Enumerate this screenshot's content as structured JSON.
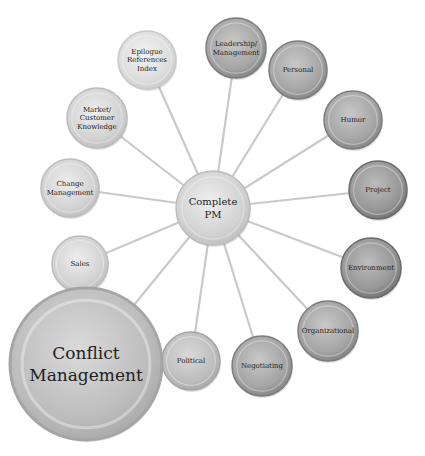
{
  "diagram": {
    "center": {
      "label_lines": [
        "Complete",
        "PM"
      ],
      "x": 213,
      "y": 208,
      "r": 37,
      "tone": "light"
    },
    "nodes": [
      {
        "id": "epilogue",
        "label_lines": [
          "Epilogue",
          "References",
          "Index"
        ],
        "x": 147,
        "y": 60,
        "r": 29,
        "tone": "lightest"
      },
      {
        "id": "leadership",
        "label_lines": [
          "Leadership/",
          "Management"
        ],
        "x": 236,
        "y": 48,
        "r": 30,
        "tone": "dark"
      },
      {
        "id": "personal",
        "label_lines": [
          "Personal"
        ],
        "x": 298,
        "y": 70,
        "r": 29,
        "tone": "dark"
      },
      {
        "id": "humor",
        "label_lines": [
          "Humor"
        ],
        "x": 353,
        "y": 120,
        "r": 29,
        "tone": "dark"
      },
      {
        "id": "project",
        "label_lines": [
          "Project"
        ],
        "x": 378,
        "y": 190,
        "r": 29,
        "tone": "darker"
      },
      {
        "id": "environment",
        "label_lines": [
          "Environment"
        ],
        "x": 371,
        "y": 268,
        "r": 30,
        "tone": "darker"
      },
      {
        "id": "organizational",
        "label_lines": [
          "Organizational"
        ],
        "x": 328,
        "y": 331,
        "r": 30,
        "tone": "dark"
      },
      {
        "id": "negotiating",
        "label_lines": [
          "Negotiating"
        ],
        "x": 262,
        "y": 366,
        "r": 30,
        "tone": "dark"
      },
      {
        "id": "political",
        "label_lines": [
          "Political"
        ],
        "x": 191,
        "y": 361,
        "r": 29,
        "tone": "medium"
      },
      {
        "id": "sales",
        "label_lines": [
          "Sales"
        ],
        "x": 80,
        "y": 264,
        "r": 28,
        "tone": "light"
      },
      {
        "id": "change",
        "label_lines": [
          "Change",
          "Management"
        ],
        "x": 70,
        "y": 188,
        "r": 29,
        "tone": "light"
      },
      {
        "id": "market",
        "label_lines": [
          "Market/",
          "Customer",
          "Knowledge"
        ],
        "x": 97,
        "y": 118,
        "r": 30,
        "tone": "light"
      },
      {
        "id": "conflict",
        "label_lines": [
          "Conflict",
          "Management"
        ],
        "x": 86,
        "y": 364,
        "r": 76,
        "tone": "medium",
        "highlight": true
      }
    ],
    "colors": {
      "connector": "#c9c9c9",
      "lightest": [
        "#f4f4f4",
        "#dcdcdc",
        "#c8c8c8"
      ],
      "light": [
        "#eeeeee",
        "#d2d2d2",
        "#bcbcbc"
      ],
      "medium": [
        "#dadada",
        "#bdbdbd",
        "#a5a5a5"
      ],
      "dark": [
        "#c8c8c8",
        "#a4a4a4",
        "#7c7c7c"
      ],
      "darker": [
        "#bcbcbc",
        "#969696",
        "#6a6a6a"
      ],
      "text": "#222222"
    }
  }
}
